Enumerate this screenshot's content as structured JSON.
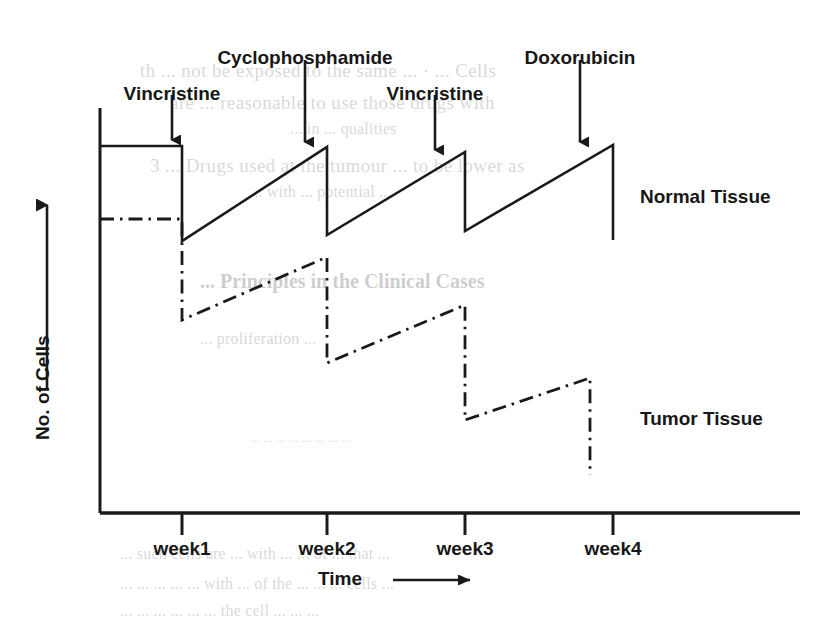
{
  "figure": {
    "type": "chemotherapy-cell-kill-diagram",
    "background": "#ffffff",
    "ink_color": "#1a1a1a"
  },
  "axes": {
    "y_title": "No. of Cells",
    "x_title": "Time",
    "x_arrow_icon": "arrow-right-icon",
    "y_arrow_icon": "arrow-up-icon",
    "tick_labels": [
      "week1",
      "week2",
      "week3",
      "week4"
    ]
  },
  "drug_arrows": [
    {
      "label": "Vincristine",
      "icon": "arrow-down-icon"
    },
    {
      "label": "Cyclophosphamide",
      "icon": "arrow-down-icon"
    },
    {
      "label": "Vincristine",
      "icon": "arrow-down-icon"
    },
    {
      "label": "Doxorubicin",
      "icon": "arrow-down-icon"
    }
  ],
  "series_labels": {
    "normal": "Normal Tissue",
    "tumor": "Tumor Tissue"
  },
  "chart_data": {
    "type": "line",
    "title": "",
    "subtitle": "",
    "xlabel": "Time",
    "ylabel": "No. of Cells",
    "grid": false,
    "legend_position": "inline-right",
    "x_axis": {
      "categories": [
        "week1",
        "week2",
        "week3",
        "week4"
      ],
      "tick_positions_px": [
        182,
        327,
        465,
        613
      ],
      "axis_y_px": 513,
      "axis_x_start_px": 100,
      "axis_x_end_px": 800,
      "note": "time axis, arbitrary units, increasing left to right"
    },
    "y_axis": {
      "note": "number of cells, arbitrary log-like units, no tick labels shown",
      "axis_top_px": 108,
      "axis_bottom_px": 513
    },
    "annotations": [
      {
        "text": "Vincristine",
        "x_px": 172,
        "label_y_px": 83,
        "arrow_from_y_px": 95,
        "arrow_to_y_px": 140
      },
      {
        "text": "Cyclophosphamide",
        "x_px": 305,
        "label_y_px": 47,
        "arrow_from_y_px": 60,
        "arrow_to_y_px": 142
      },
      {
        "text": "Vincristine",
        "x_px": 435,
        "label_y_px": 83,
        "arrow_from_y_px": 95,
        "arrow_to_y_px": 150
      },
      {
        "text": "Doxorubicin",
        "x_px": 580,
        "label_y_px": 47,
        "arrow_from_y_px": 60,
        "arrow_to_y_px": 142
      }
    ],
    "series": [
      {
        "name": "Normal Tissue",
        "style": "solid",
        "label_x_px": 640,
        "label_y_px": 196,
        "description": "Flat plateau, then repeated sharp drop at each drug dose followed by full regrowth back to baseline before the next dose.",
        "points_px": [
          [
            100,
            146
          ],
          [
            182,
            146
          ],
          [
            182,
            241
          ],
          [
            327,
            147
          ],
          [
            327,
            235
          ],
          [
            465,
            152
          ],
          [
            465,
            231
          ],
          [
            613,
            145
          ],
          [
            613,
            240
          ]
        ]
      },
      {
        "name": "Tumor Tissue",
        "style": "dash-dot",
        "label_x_px": 640,
        "label_y_px": 418,
        "description": "Flat baseline, then each dose produces a larger log-kill drop with only partial regrowth, so the curve steps progressively downward.",
        "points_px": [
          [
            100,
            219
          ],
          [
            182,
            219
          ],
          [
            182,
            320
          ],
          [
            327,
            257
          ],
          [
            327,
            363
          ],
          [
            465,
            305
          ],
          [
            465,
            420
          ],
          [
            590,
            378
          ],
          [
            590,
            475
          ]
        ]
      }
    ]
  },
  "background_text": {
    "note": "faint show-through text from the reverse side of the printed page",
    "lines": [
      {
        "text": "th   ... not be exposed to the same ... · ... Cells",
        "x": 140,
        "y": 60,
        "style": "b-serif-big"
      },
      {
        "text": "are ... reasonable to use those drugs with",
        "x": 170,
        "y": 92,
        "style": "b-serif-big"
      },
      {
        "text": "... in  ... qualities",
        "x": 290,
        "y": 120,
        "style": "b-serif-med"
      },
      {
        "text": "3 ... Drugs used at the tumour ...  to be lower as",
        "x": 150,
        "y": 155,
        "style": "b-serif-big"
      },
      {
        "text": "...  with  ... potential ...",
        "x": 250,
        "y": 183,
        "style": "b-serif-med"
      },
      {
        "text": "... Principles in the Clinical Cases",
        "x": 200,
        "y": 270,
        "style": "b-head"
      },
      {
        "text": "... proliferation ...",
        "x": 200,
        "y": 330,
        "style": "b-serif-med"
      },
      {
        "text": "... ... ... ... ... ... ... ...",
        "x": 250,
        "y": 430,
        "style": "b-small"
      },
      {
        "text": "... such cells are  ... with ... ...  of ...  that ...",
        "x": 120,
        "y": 545,
        "style": "b-serif-med"
      },
      {
        "text": "... ... ...  ...  ...  with  ...  of the  ... ... ... cells ...",
        "x": 120,
        "y": 575,
        "style": "b-serif-med"
      },
      {
        "text": "... ...  ...  ...  ... ...  the cell  ... ... ...",
        "x": 120,
        "y": 602,
        "style": "b-serif-med"
      }
    ]
  }
}
